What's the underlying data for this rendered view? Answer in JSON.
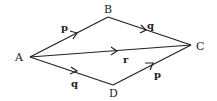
{
  "diagram": {
    "points": {
      "A": {
        "label": "A",
        "x": 30,
        "y": 57
      },
      "B": {
        "label": "B",
        "x": 108,
        "y": 17
      },
      "C": {
        "label": "C",
        "x": 191,
        "y": 45
      },
      "D": {
        "label": "D",
        "x": 113,
        "y": 85
      }
    },
    "edges": [
      {
        "from": "A",
        "to": "B",
        "label": "p"
      },
      {
        "from": "B",
        "to": "C",
        "label": "q"
      },
      {
        "from": "A",
        "to": "C",
        "label": "r"
      },
      {
        "from": "A",
        "to": "D",
        "label": "q"
      },
      {
        "from": "D",
        "to": "C",
        "label": "p"
      }
    ]
  }
}
